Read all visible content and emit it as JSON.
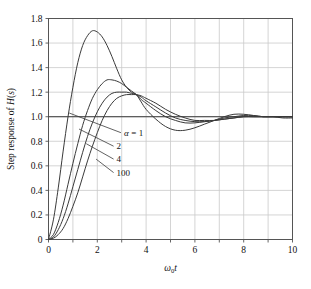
{
  "chart_data": {
    "type": "line",
    "title": "",
    "xlabel": "ω₀t",
    "ylabel": "Step response of H(s)",
    "xlim": [
      0,
      10
    ],
    "ylim": [
      0,
      1.8
    ],
    "xticks": [
      0,
      2,
      4,
      6,
      8,
      10
    ],
    "xtick_labels": [
      "0",
      "2",
      "4",
      "6",
      "8",
      "10"
    ],
    "xminor_step": 1,
    "yticks": [
      0,
      0.2,
      0.4,
      0.6,
      0.8,
      1.0,
      1.2,
      1.4,
      1.6,
      1.8
    ],
    "ytick_labels": [
      "0",
      "0.2",
      "0.4",
      "0.6",
      "0.8",
      "1.0",
      "1.2",
      "1.4",
      "1.6",
      "1.8"
    ],
    "grid": true,
    "legend_position": "inline-annotations",
    "reference_line_y": 1.0,
    "series": [
      {
        "name": "α = 1",
        "alpha": 1,
        "peak_value": 1.7,
        "peak_x": 1.9,
        "undershoot_value": 0.89,
        "undershoot_x": 5.7,
        "x": [
          0,
          0.2,
          0.4,
          0.6,
          0.8,
          1.0,
          1.2,
          1.4,
          1.6,
          1.8,
          2.0,
          2.2,
          2.4,
          2.6,
          2.8,
          3.0,
          3.2,
          3.4,
          3.6,
          3.8,
          4.0,
          4.4,
          4.8,
          5.2,
          5.6,
          6.0,
          6.4,
          6.8,
          7.2,
          7.6,
          8.0,
          8.4,
          8.8,
          9.2,
          9.6,
          10.0
        ],
        "y": [
          0,
          0.16,
          0.42,
          0.72,
          1.0,
          1.24,
          1.44,
          1.58,
          1.66,
          1.7,
          1.69,
          1.65,
          1.58,
          1.49,
          1.39,
          1.3,
          1.24,
          1.2,
          1.18,
          1.12,
          1.06,
          0.98,
          0.92,
          0.89,
          0.89,
          0.91,
          0.94,
          0.97,
          1.0,
          1.02,
          1.02,
          1.01,
          1.0,
          1.0,
          0.99,
          0.99
        ]
      },
      {
        "name": "2",
        "alpha": 2,
        "peak_value": 1.3,
        "peak_x": 2.5,
        "undershoot_value": 0.95,
        "undershoot_x": 6.0,
        "x": [
          0,
          0.2,
          0.4,
          0.6,
          0.8,
          1.0,
          1.2,
          1.4,
          1.6,
          1.8,
          2.0,
          2.2,
          2.4,
          2.6,
          2.8,
          3.0,
          3.2,
          3.4,
          3.6,
          3.8,
          4.0,
          4.4,
          4.8,
          5.2,
          5.6,
          6.0,
          6.4,
          6.8,
          7.2,
          7.6,
          8.0,
          8.4,
          8.8,
          9.2,
          9.6,
          10.0
        ],
        "y": [
          0,
          0.04,
          0.14,
          0.28,
          0.45,
          0.62,
          0.78,
          0.93,
          1.05,
          1.15,
          1.22,
          1.27,
          1.3,
          1.3,
          1.29,
          1.27,
          1.24,
          1.21,
          1.18,
          1.14,
          1.11,
          1.05,
          1.0,
          0.97,
          0.95,
          0.95,
          0.96,
          0.97,
          0.99,
          1.0,
          1.01,
          1.01,
          1.0,
          1.0,
          1.0,
          1.0
        ]
      },
      {
        "name": "4",
        "alpha": 4,
        "peak_value": 1.2,
        "peak_x": 2.9,
        "undershoot_value": 0.96,
        "undershoot_x": 6.2,
        "x": [
          0,
          0.2,
          0.4,
          0.6,
          0.8,
          1.0,
          1.2,
          1.4,
          1.6,
          1.8,
          2.0,
          2.2,
          2.4,
          2.6,
          2.8,
          3.0,
          3.2,
          3.4,
          3.6,
          3.8,
          4.0,
          4.4,
          4.8,
          5.2,
          5.6,
          6.0,
          6.4,
          6.8,
          7.2,
          7.6,
          8.0,
          8.4,
          8.8,
          9.2,
          9.6,
          10.0
        ],
        "y": [
          0,
          0.02,
          0.08,
          0.17,
          0.29,
          0.43,
          0.57,
          0.71,
          0.84,
          0.95,
          1.04,
          1.11,
          1.16,
          1.19,
          1.2,
          1.2,
          1.2,
          1.19,
          1.18,
          1.16,
          1.13,
          1.08,
          1.03,
          0.99,
          0.97,
          0.96,
          0.96,
          0.97,
          0.98,
          0.99,
          1.0,
          1.0,
          1.0,
          1.0,
          1.0,
          1.0
        ]
      },
      {
        "name": "100",
        "alpha": 100,
        "peak_value": 1.17,
        "peak_x": 3.5,
        "undershoot_value": 0.97,
        "undershoot_x": 6.5,
        "x": [
          0,
          0.2,
          0.4,
          0.6,
          0.8,
          1.0,
          1.2,
          1.4,
          1.6,
          1.8,
          2.0,
          2.2,
          2.4,
          2.6,
          2.8,
          3.0,
          3.2,
          3.4,
          3.6,
          3.8,
          4.0,
          4.4,
          4.8,
          5.2,
          5.6,
          6.0,
          6.4,
          6.8,
          7.2,
          7.6,
          8.0,
          8.4,
          8.8,
          9.2,
          9.6,
          10.0
        ],
        "y": [
          0,
          0.01,
          0.04,
          0.09,
          0.17,
          0.27,
          0.38,
          0.51,
          0.64,
          0.76,
          0.87,
          0.97,
          1.05,
          1.11,
          1.15,
          1.17,
          1.18,
          1.18,
          1.18,
          1.17,
          1.15,
          1.11,
          1.06,
          1.02,
          0.99,
          0.97,
          0.97,
          0.97,
          0.98,
          0.99,
          1.0,
          1.0,
          1.0,
          1.0,
          1.0,
          1.0
        ]
      }
    ],
    "annotations": [
      {
        "label": "α  =  1",
        "symbol": "α",
        "eq": "=",
        "value": "1",
        "leader_from_x": 0.85,
        "leader_from_y": 1.03,
        "text_x": 3.05,
        "text_y": 0.87
      },
      {
        "label": "2",
        "value": "2",
        "leader_from_x": 1.25,
        "leader_from_y": 0.9,
        "text_x": 2.75,
        "text_y": 0.76
      },
      {
        "label": "4",
        "value": "4",
        "leader_from_x": 1.55,
        "leader_from_y": 0.78,
        "text_x": 2.75,
        "text_y": 0.655
      },
      {
        "label": "100",
        "value": "100",
        "leader_from_x": 1.95,
        "leader_from_y": 0.655,
        "text_x": 2.75,
        "text_y": 0.545
      }
    ],
    "colors": {
      "curve": "#3a3a3a",
      "grid": "#c9c9c9",
      "axis": "#555555",
      "reference_line": "#3a3a3a",
      "background": "#ffffff"
    }
  }
}
